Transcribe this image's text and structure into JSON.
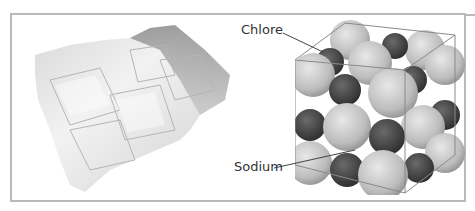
{
  "figure": {
    "left_panel": {
      "subject": "salt-crystal-photo"
    },
    "right_panel": {
      "subject": "sodium-chloride-lattice-model",
      "labels": {
        "chlorine": "Chlore",
        "sodium": "Sodium"
      }
    },
    "colors": {
      "frame": "#b9b9b9",
      "chlorine_sphere": "#c8c8c8",
      "sodium_sphere": "#4a4a4a",
      "cube_edges": "#8a8a8a"
    }
  }
}
